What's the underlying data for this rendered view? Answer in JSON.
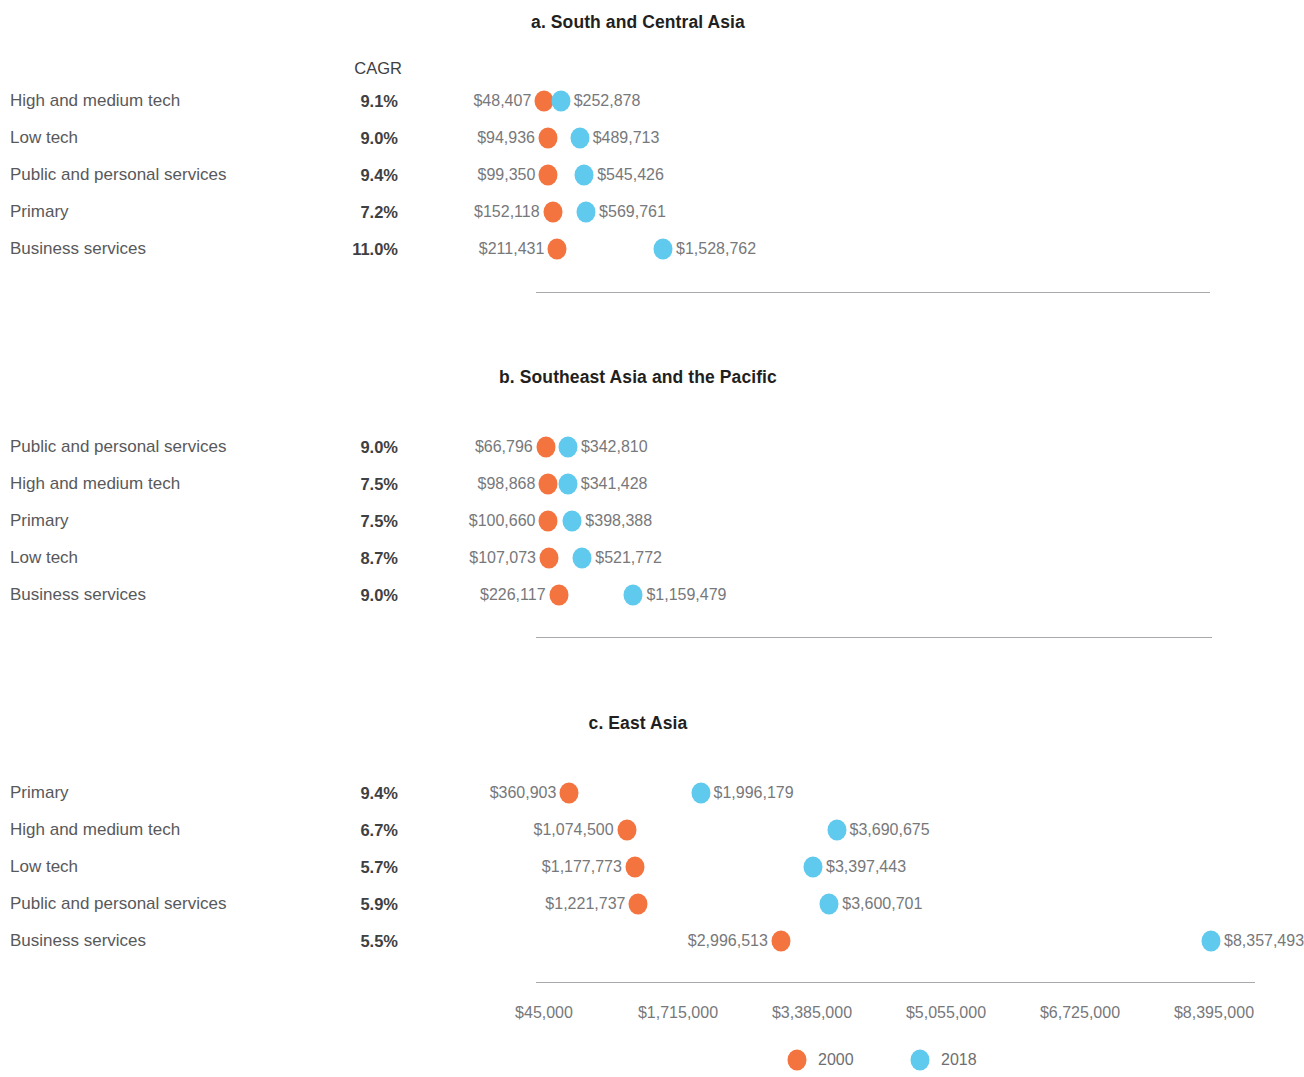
{
  "colors": {
    "series_2000": "#f4743f",
    "series_2018": "#5fc9ee",
    "label_text": "#77787b",
    "row_text": "#58595b",
    "title_text": "#231f20",
    "axis_line": "#a7a9ac"
  },
  "cagr_header": "CAGR",
  "legend": {
    "items": [
      {
        "label": "2000",
        "color": "#f4743f"
      },
      {
        "label": "2018",
        "color": "#5fc9ee"
      }
    ]
  },
  "axis": {
    "ticks": [
      "$45,000",
      "$1,715,000",
      "$3,385,000",
      "$5,055,000",
      "$6,725,000",
      "$8,395,000"
    ],
    "tick_values": [
      45000,
      1715000,
      3385000,
      5055000,
      6725000,
      8395000
    ],
    "min": 45000,
    "max": 8395000
  },
  "chart_data": {
    "type": "scatter",
    "xlabel": "",
    "ylabel": "",
    "xlim": [
      45000,
      8395000
    ],
    "grid": false,
    "legend_position": "bottom-center",
    "tick_labels": [
      "$45,000",
      "$1,715,000",
      "$3,385,000",
      "$5,055,000",
      "$6,725,000",
      "$8,395,000"
    ],
    "series": [
      {
        "name": "2000",
        "color": "#f4743f"
      },
      {
        "name": "2018",
        "color": "#5fc9ee"
      }
    ],
    "panels": [
      {
        "id": "a",
        "title": "a. South and Central Asia",
        "rows": [
          {
            "label": "High and medium tech",
            "cagr": "9.1%",
            "v2000": 48407,
            "v2018": 252878,
            "l2000": "$48,407",
            "l2018": "$252,878"
          },
          {
            "label": "Low tech",
            "cagr": "9.0%",
            "v2000": 94936,
            "v2018": 489713,
            "l2000": "$94,936",
            "l2018": "$489,713"
          },
          {
            "label": "Public and personal services",
            "cagr": "9.4%",
            "v2000": 99350,
            "v2018": 545426,
            "l2000": "$99,350",
            "l2018": "$545,426"
          },
          {
            "label": "Primary",
            "cagr": "7.2%",
            "v2000": 152118,
            "v2018": 569761,
            "l2000": "$152,118",
            "l2018": "$569,761"
          },
          {
            "label": "Business services",
            "cagr": "11.0%",
            "v2000": 211431,
            "v2018": 1528762,
            "l2000": "$211,431",
            "l2018": "$1,528,762"
          }
        ]
      },
      {
        "id": "b",
        "title": "b. Southeast Asia and the Pacific",
        "rows": [
          {
            "label": "Public and personal services",
            "cagr": "9.0%",
            "v2000": 66796,
            "v2018": 342810,
            "l2000": "$66,796",
            "l2018": "$342,810"
          },
          {
            "label": "High and medium tech",
            "cagr": "7.5%",
            "v2000": 98868,
            "v2018": 341428,
            "l2000": "$98,868",
            "l2018": "$341,428"
          },
          {
            "label": "Primary",
            "cagr": "7.5%",
            "v2000": 100660,
            "v2018": 398388,
            "l2000": "$100,660",
            "l2018": "$398,388"
          },
          {
            "label": "Low tech",
            "cagr": "8.7%",
            "v2000": 107073,
            "v2018": 521772,
            "l2000": "$107,073",
            "l2018": "$521,772"
          },
          {
            "label": "Business services",
            "cagr": "9.0%",
            "v2000": 226117,
            "v2018": 1159479,
            "l2000": "$226,117",
            "l2018": "$1,159,479"
          }
        ]
      },
      {
        "id": "c",
        "title": "c. East Asia",
        "rows": [
          {
            "label": "Primary",
            "cagr": "9.4%",
            "v2000": 360903,
            "v2018": 1996179,
            "l2000": "$360,903",
            "l2018": "$1,996,179"
          },
          {
            "label": "High and medium tech",
            "cagr": "6.7%",
            "v2000": 1074500,
            "v2018": 3690675,
            "l2000": "$1,074,500",
            "l2018": "$3,690,675"
          },
          {
            "label": "Low tech",
            "cagr": "5.7%",
            "v2000": 1177773,
            "v2018": 3397443,
            "l2000": "$1,177,773",
            "l2018": "$3,397,443"
          },
          {
            "label": "Public and personal services",
            "cagr": "5.9%",
            "v2000": 1221737,
            "v2018": 3600701,
            "l2000": "$1,221,737",
            "l2018": "$3,600,701"
          },
          {
            "label": "Business services",
            "cagr": "5.5%",
            "v2000": 2996513,
            "v2018": 8357493,
            "l2000": "$2,996,513",
            "l2018": "$8,357,493"
          }
        ]
      }
    ]
  }
}
